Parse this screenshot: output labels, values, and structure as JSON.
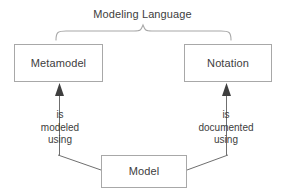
{
  "diagram": {
    "title": "Modeling Language",
    "background_color": "#ffffff",
    "stroke_color": "#a8a8a8",
    "arrow_color": "#4d4d4d",
    "text_color": "#3d3d3d",
    "nodes": [
      {
        "id": "metamodel",
        "label": "Metamodel"
      },
      {
        "id": "notation",
        "label": "Notation"
      },
      {
        "id": "model",
        "label": "Model"
      }
    ],
    "group_brace": {
      "label": "Modeling Language",
      "spans": [
        "metamodel",
        "notation"
      ]
    },
    "edges": [
      {
        "id": "model-to-metamodel",
        "from": "model",
        "to": "metamodel",
        "arrow": "solid-triangle-up",
        "label_lines": [
          "is",
          "modeled",
          "using"
        ]
      },
      {
        "id": "model-to-notation",
        "from": "model",
        "to": "notation",
        "arrow": "solid-triangle-up",
        "label_lines": [
          "is",
          "documented",
          "using"
        ]
      }
    ]
  }
}
